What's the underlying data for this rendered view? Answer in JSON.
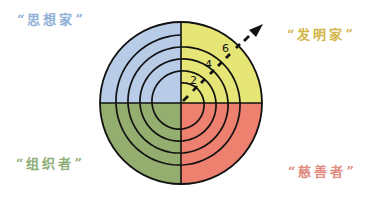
{
  "diagram": {
    "type": "quadrant-spiral",
    "center": [
      181,
      103
    ],
    "radius": 81,
    "quadrants": [
      {
        "position": "top-left",
        "label": "“思想家”",
        "fill": "#B8CCE8",
        "label_color": "#8FB0D8"
      },
      {
        "position": "top-right",
        "label": "“发明家”",
        "fill": "#E6E676",
        "label_color": "#D2B548"
      },
      {
        "position": "bottom-left",
        "label": "“组织者”",
        "fill": "#94AE70",
        "label_color": "#8DAE78"
      },
      {
        "position": "bottom-right",
        "label": "“慈善者”",
        "fill": "#EE8070",
        "label_color": "#E08A80"
      }
    ],
    "spiral": {
      "turns": 4,
      "inner_radius": 20,
      "outer_radius": 68,
      "stroke": "#111111"
    },
    "arrow": {
      "direction": "up-right",
      "style": "dashed",
      "ticks": [
        {
          "label": "2"
        },
        {
          "label": "4"
        },
        {
          "label": "6"
        }
      ]
    }
  }
}
